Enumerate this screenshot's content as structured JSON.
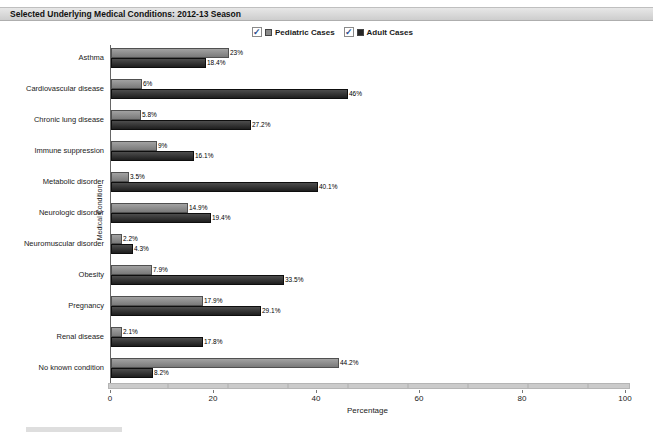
{
  "title_bar": {
    "text": "Selected Underlying Medical Conditions: 2012-13 Season"
  },
  "legend": {
    "items": [
      {
        "label": "Pediatric Cases",
        "checked": true,
        "check_glyph": "✓",
        "swatch_color": "#8a8a8a"
      },
      {
        "label": "Adult Cases",
        "checked": true,
        "check_glyph": "✓",
        "swatch_color": "#262626"
      }
    ]
  },
  "axis": {
    "xlabel": "Percentage",
    "ylabel": "Medical Condition"
  },
  "colors": {
    "pediatric_bar": "#8a8a8a",
    "adult_bar": "#262626",
    "title_bar_bg": "#d8d8d8",
    "axis_track": "#c9c9c9"
  },
  "chart_data": {
    "type": "bar",
    "orientation": "horizontal",
    "title": "Selected Underlying Medical Conditions: 2012-13 Season",
    "xlabel": "Percentage",
    "ylabel": "Medical Condition",
    "xlim": [
      0,
      100
    ],
    "xticks": [
      0,
      20,
      40,
      60,
      80,
      100
    ],
    "grid": false,
    "legend_position": "top",
    "categories": [
      "Asthma",
      "Cardiovascular disease",
      "Chronic lung disease",
      "Immune suppression",
      "Metabolic disorder",
      "Neurologic disorder",
      "Neuromuscular disorder",
      "Obesity",
      "Pregnancy",
      "Renal disease",
      "No known condition"
    ],
    "series": [
      {
        "name": "Pediatric Cases",
        "values": [
          23,
          6,
          5.8,
          9,
          3.5,
          14.9,
          2.2,
          7.9,
          17.9,
          2.1,
          44.2
        ],
        "labels": [
          "23%",
          "6%",
          "5.8%",
          "9%",
          "3.5%",
          "14.9%",
          "2.2%",
          "7.9%",
          "17.9%",
          "2.1%",
          "44.2%"
        ]
      },
      {
        "name": "Adult Cases",
        "values": [
          18.4,
          46,
          27.2,
          16.1,
          40.1,
          19.4,
          4.3,
          33.5,
          29.1,
          17.8,
          8.2
        ],
        "labels": [
          "18.4%",
          "46%",
          "27.2%",
          "16.1%",
          "40.1%",
          "19.4%",
          "4.3%",
          "33.5%",
          "29.1%",
          "17.8%",
          "8.2%"
        ]
      }
    ]
  }
}
